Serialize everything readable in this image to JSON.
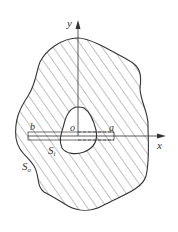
{
  "diagram": {
    "axes": {
      "x_label": "x",
      "y_label": "y",
      "origin_label": "o"
    },
    "points": {
      "a_label": "a",
      "b_label": "b"
    },
    "boundaries": {
      "inner_label": "S",
      "inner_subscript": "i",
      "outer_label": "S",
      "outer_subscript": "o"
    },
    "colors": {
      "stroke": "#333333",
      "hatch": "#666666",
      "background": "#ffffff"
    }
  }
}
